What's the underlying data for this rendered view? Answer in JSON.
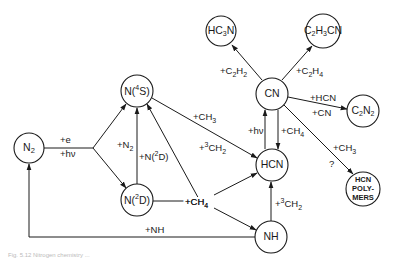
{
  "diagram": {
    "type": "reaction-network",
    "nodes": {
      "n2": {
        "label": "N",
        "sub": "2"
      },
      "n4s": {
        "label": "N(",
        "sup": "4",
        "tail": "S)"
      },
      "n2d": {
        "label": "N(",
        "sup": "2",
        "tail": "D)"
      },
      "cn": {
        "label": "CN"
      },
      "hcn": {
        "label": "HCN"
      },
      "nh": {
        "label": "NH"
      },
      "hc3n": {
        "pre": "HC",
        "sub": "3",
        "tail": "N"
      },
      "c2h3cn": {
        "pre": "C",
        "sub1": "2",
        "mid": "H",
        "sub2": "3",
        "tail": "CN"
      },
      "c2n2": {
        "pre": "C",
        "sub1": "2",
        "mid": "N",
        "sub2": "2"
      },
      "polymers": {
        "line1": "HCN",
        "line2": "POLY-",
        "line3": "MERS"
      }
    },
    "edge_labels": {
      "e": "+e",
      "hv_n2": "+hν",
      "plus_n2": "+N",
      "plus_n2_sub": "2",
      "plus_n2d": "+N(",
      "plus_n2d_sup": "2",
      "plus_n2d_tail": "D)",
      "ch3_a": "+CH",
      "ch3_a_sub": "3",
      "ch2_a_pre": "+",
      "ch2_a_sup": "3",
      "ch2_a_tail": "CH",
      "ch2_a_sub": "2",
      "ch4_mid": "+CH",
      "ch4_mid_sub": "4",
      "hv_cn": "+hν",
      "ch4_cn": "+CH",
      "ch4_cn_sub": "4",
      "c2h2": "+C",
      "c2h2_s1": "2",
      "c2h2_m": "H",
      "c2h2_s2": "2",
      "c2h4": "+C",
      "c2h4_s1": "2",
      "c2h4_m": "H",
      "c2h4_s2": "4",
      "hcn_add": "+HCN",
      "cn_add": "+CN",
      "ch3_b": "+CH",
      "ch3_b_sub": "3",
      "question": "?",
      "ch2_b_pre": "+",
      "ch2_b_sup": "3",
      "ch2_b_tail": "CH",
      "ch2_b_sub": "2",
      "nh_add": "+NH"
    },
    "caption": "Fig. 5.12  Nitrogen chemistry ..."
  }
}
